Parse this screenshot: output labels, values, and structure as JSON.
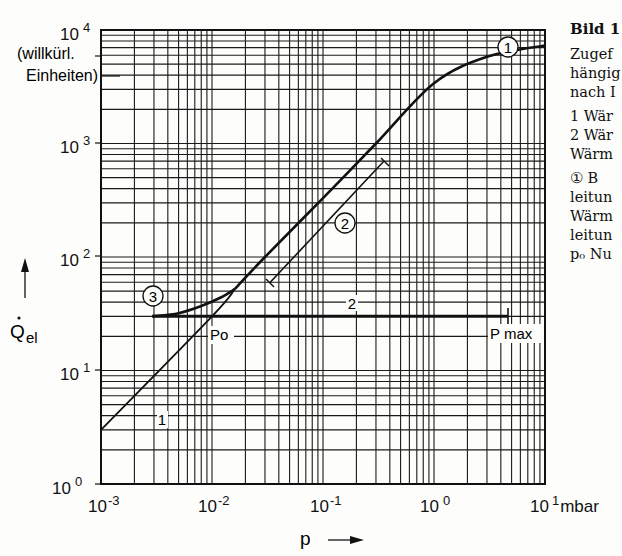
{
  "chart_data": {
    "type": "line",
    "title": "",
    "xlabel": "p",
    "xunit": "mbar",
    "ylabel": "Q̇ el",
    "yunit_note": "(willkürl. Einheiten)",
    "xscale": "log",
    "yscale": "log",
    "xlim": [
      0.001,
      10
    ],
    "ylim": [
      1,
      10000
    ],
    "grid": true,
    "x_ticks": [
      "10^-3",
      "10^-2",
      "10^-1",
      "10^0",
      "10^1"
    ],
    "y_ticks": [
      "10^0",
      "10^1",
      "10^2",
      "10^3",
      "10^4"
    ],
    "series": [
      {
        "name": "1",
        "label": "1",
        "style": "thin",
        "x": [
          0.001,
          0.01,
          0.016
        ],
        "y": [
          3,
          30,
          52
        ]
      },
      {
        "name": "2",
        "label": "2",
        "style": "bold-horizontal",
        "x": [
          0.0029,
          4.6
        ],
        "y": [
          30,
          30
        ]
      },
      {
        "name": "①",
        "label": "①",
        "style": "thick",
        "x": [
          0.016,
          0.03,
          0.1,
          0.3,
          1,
          3,
          10
        ],
        "y": [
          52,
          100,
          330,
          1000,
          3400,
          5800,
          7300
        ]
      },
      {
        "name": "②",
        "label": "②",
        "style": "thin-segment",
        "x": [
          0.033,
          0.35
        ],
        "y": [
          59,
          690
        ]
      },
      {
        "name": "③",
        "label": "③",
        "style": "thick",
        "x": [
          0.0029,
          0.005,
          0.008,
          0.012,
          0.016
        ],
        "y": [
          30,
          32,
          37,
          44,
          52
        ]
      }
    ],
    "annotations": [
      {
        "text": "p0",
        "x": 0.01,
        "y": 30
      },
      {
        "text": "p max",
        "x": 4.6,
        "y": 30
      }
    ]
  },
  "axis": {
    "y_tick_labels": [
      {
        "base": "10",
        "exp": "4"
      },
      {
        "base": "10",
        "exp": "3"
      },
      {
        "base": "10",
        "exp": "2"
      },
      {
        "base": "10",
        "exp": "1"
      },
      {
        "base": "10",
        "exp": "0"
      }
    ],
    "x_tick_labels": [
      {
        "base": "10",
        "exp": "-3"
      },
      {
        "base": "10",
        "exp": "-2"
      },
      {
        "base": "10",
        "exp": "-1"
      },
      {
        "base": "10",
        "exp": "0"
      },
      {
        "base": "10",
        "exp": "1"
      }
    ],
    "x_unit": "mbar",
    "y_unit_line1": "(willkürl.",
    "y_unit_line2": "Einheiten)",
    "x_label": "p",
    "y_label_main": "Q",
    "y_label_sub": "el"
  },
  "labels": {
    "curve1_circled": "1",
    "curve2_circled": "2",
    "curve3_circled": "3",
    "line1": "1",
    "line2": "2",
    "p0": "Po",
    "pmax": "P max"
  },
  "caption": {
    "title": "Bild 1",
    "lines": [
      "Zugef",
      "hängig",
      "nach I",
      "1 Wär",
      "2 Wär",
      "Wärm",
      "① B",
      "leitun",
      "Wärm",
      "leitun",
      "p₀ Nu"
    ]
  }
}
